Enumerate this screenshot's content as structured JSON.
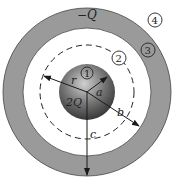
{
  "diagram": {
    "title": "",
    "shell_charge": "−Q",
    "sphere_charge": "2Q",
    "radii_labels": {
      "inner": "a",
      "shell_inner": "b",
      "shell_outer": "c",
      "gaussian": "r"
    },
    "regions": [
      "1",
      "2",
      "3",
      "4"
    ],
    "colors": {
      "shell": "#9a9a9a",
      "sphere_dark": "#3a3a3a",
      "sphere_light": "#c8c8c8",
      "line": "#1a1a1a"
    }
  }
}
